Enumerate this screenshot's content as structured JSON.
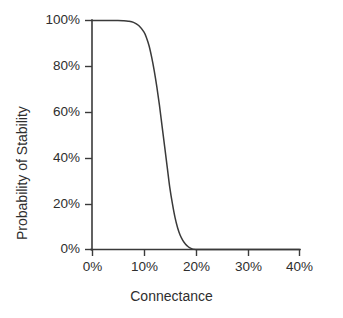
{
  "chart_data": {
    "type": "line",
    "title": "",
    "xlabel": "Connectance",
    "ylabel": "Probability of Stability",
    "xlim": [
      0,
      40
    ],
    "ylim": [
      0,
      100
    ],
    "xticks": [
      "0%",
      "10%",
      "20%",
      "30%",
      "40%"
    ],
    "xtick_values": [
      0,
      10,
      20,
      30,
      40
    ],
    "yticks": [
      "0%",
      "20%",
      "40%",
      "60%",
      "80%",
      "100%"
    ],
    "ytick_values": [
      0,
      20,
      40,
      60,
      80,
      100
    ],
    "grid": false,
    "legend": null,
    "line_color": "#3a3a3a",
    "axis_color": "#3a3a3a",
    "background_color": "#ffffff",
    "series": [
      {
        "name": "Probability of Stability",
        "x": [
          0,
          1,
          2,
          3,
          4,
          5,
          6,
          7,
          8,
          9,
          10,
          10.5,
          11,
          11.5,
          12,
          12.5,
          13,
          13.5,
          14,
          14.5,
          15,
          15.5,
          16,
          16.5,
          17,
          17.5,
          18,
          18.5,
          19,
          20,
          25,
          30,
          35,
          40
        ],
        "y": [
          100,
          100,
          100,
          100,
          100,
          100,
          99.9,
          99.7,
          99.2,
          97.8,
          95,
          92.5,
          89,
          84,
          78,
          71,
          63,
          54,
          45,
          36,
          27,
          20,
          14,
          9.5,
          6.2,
          4,
          2.4,
          1.3,
          0.6,
          0,
          0,
          0,
          0,
          0
        ]
      }
    ]
  },
  "axes": {
    "x_tick_labels": [
      "0%",
      "10%",
      "20%",
      "30%",
      "40%"
    ],
    "y_tick_labels": [
      "100%",
      "80%",
      "60%",
      "40%",
      "20%",
      "0%"
    ],
    "x_axis_title": "Connectance",
    "y_axis_title": "Probability of Stability"
  }
}
